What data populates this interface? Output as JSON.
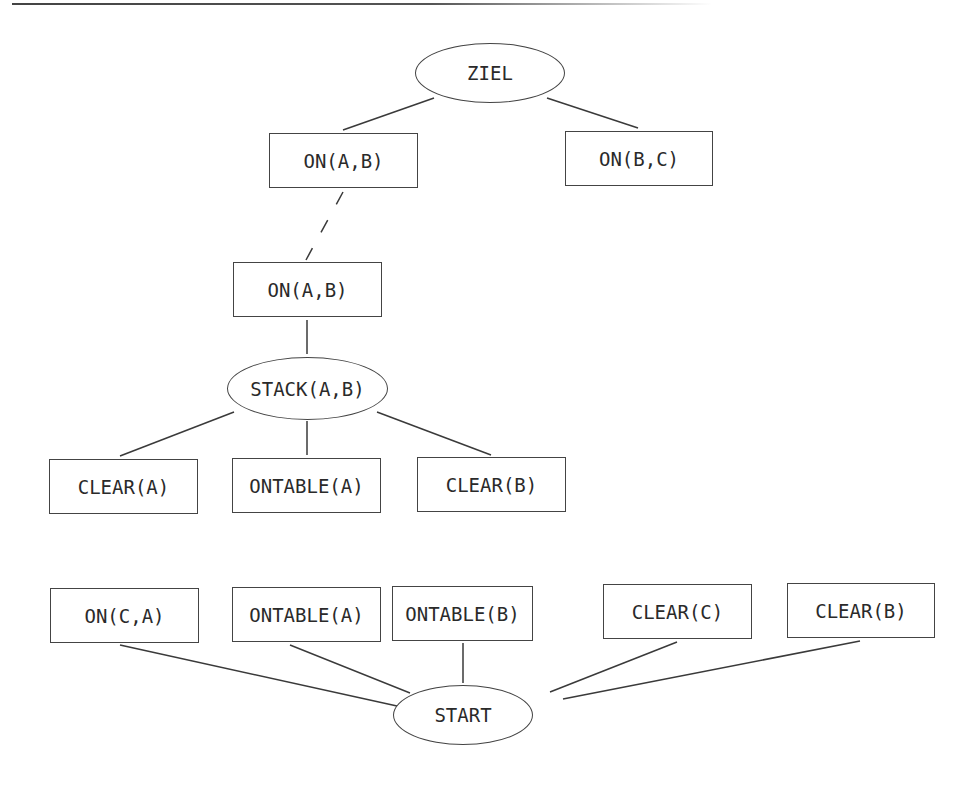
{
  "nodes": [
    {
      "id": "ziel",
      "label": "ZIEL",
      "shape": "ellipse",
      "x": 415,
      "y": 43,
      "w": 150,
      "h": 60
    },
    {
      "id": "on_ab_1",
      "label": "ON(A,B)",
      "shape": "box",
      "x": 269,
      "y": 133,
      "w": 149,
      "h": 55
    },
    {
      "id": "on_bc",
      "label": "ON(B,C)",
      "shape": "box",
      "x": 565,
      "y": 131,
      "w": 148,
      "h": 55
    },
    {
      "id": "on_ab_2",
      "label": "ON(A,B)",
      "shape": "box",
      "x": 233,
      "y": 262,
      "w": 149,
      "h": 55
    },
    {
      "id": "stack_ab",
      "label": "STACK(A,B)",
      "shape": "ellipse",
      "x": 227,
      "y": 357,
      "w": 161,
      "h": 63
    },
    {
      "id": "clear_a",
      "label": "CLEAR(A)",
      "shape": "box",
      "x": 49,
      "y": 459,
      "w": 149,
      "h": 55
    },
    {
      "id": "ontable_a_1",
      "label": "ONTABLE(A)",
      "shape": "box",
      "x": 232,
      "y": 458,
      "w": 149,
      "h": 55
    },
    {
      "id": "clear_b_1",
      "label": "CLEAR(B)",
      "shape": "box",
      "x": 417,
      "y": 457,
      "w": 149,
      "h": 55
    },
    {
      "id": "on_ca",
      "label": "ON(C,A)",
      "shape": "box",
      "x": 50,
      "y": 588,
      "w": 149,
      "h": 55
    },
    {
      "id": "ontable_a_2",
      "label": "ONTABLE(A)",
      "shape": "box",
      "x": 232,
      "y": 587,
      "w": 149,
      "h": 55
    },
    {
      "id": "ontable_b",
      "label": "ONTABLE(B)",
      "shape": "box",
      "x": 392,
      "y": 586,
      "w": 141,
      "h": 55
    },
    {
      "id": "clear_c",
      "label": "CLEAR(C)",
      "shape": "box",
      "x": 603,
      "y": 584,
      "w": 149,
      "h": 55
    },
    {
      "id": "clear_b_2",
      "label": "CLEAR(B)",
      "shape": "box",
      "x": 787,
      "y": 583,
      "w": 148,
      "h": 55
    },
    {
      "id": "start",
      "label": "START",
      "shape": "ellipse",
      "x": 393,
      "y": 685,
      "w": 140,
      "h": 60
    }
  ],
  "edges": [
    {
      "from": "ziel",
      "to": "on_ab_1",
      "style": "solid",
      "x1": 434,
      "y1": 98,
      "x2": 343,
      "y2": 130
    },
    {
      "from": "ziel",
      "to": "on_bc",
      "style": "solid",
      "x1": 547,
      "y1": 98,
      "x2": 638,
      "y2": 128
    },
    {
      "from": "on_ab_1",
      "to": "on_ab_2",
      "style": "dashed",
      "x1": 343,
      "y1": 192,
      "x2": 306,
      "y2": 260
    },
    {
      "from": "on_ab_2",
      "to": "stack_ab",
      "style": "solid",
      "x1": 307,
      "y1": 320,
      "x2": 307,
      "y2": 354
    },
    {
      "from": "stack_ab",
      "to": "clear_a",
      "style": "solid",
      "x1": 234,
      "y1": 412,
      "x2": 120,
      "y2": 456
    },
    {
      "from": "stack_ab",
      "to": "ontable_a_1",
      "style": "solid",
      "x1": 307,
      "y1": 421,
      "x2": 307,
      "y2": 455
    },
    {
      "from": "stack_ab",
      "to": "clear_b_1",
      "style": "solid",
      "x1": 377,
      "y1": 412,
      "x2": 491,
      "y2": 455
    },
    {
      "from": "on_ca",
      "to": "start",
      "style": "solid",
      "x1": 120,
      "y1": 645,
      "x2": 397,
      "y2": 706
    },
    {
      "from": "ontable_a_2",
      "to": "start",
      "style": "solid",
      "x1": 290,
      "y1": 645,
      "x2": 410,
      "y2": 693
    },
    {
      "from": "ontable_b",
      "to": "start",
      "style": "solid",
      "x1": 463,
      "y1": 643,
      "x2": 463,
      "y2": 683
    },
    {
      "from": "clear_c",
      "to": "start",
      "style": "solid",
      "x1": 677,
      "y1": 642,
      "x2": 550,
      "y2": 692
    },
    {
      "from": "clear_b_2",
      "to": "start",
      "style": "solid",
      "x1": 860,
      "y1": 641,
      "x2": 563,
      "y2": 699
    }
  ]
}
